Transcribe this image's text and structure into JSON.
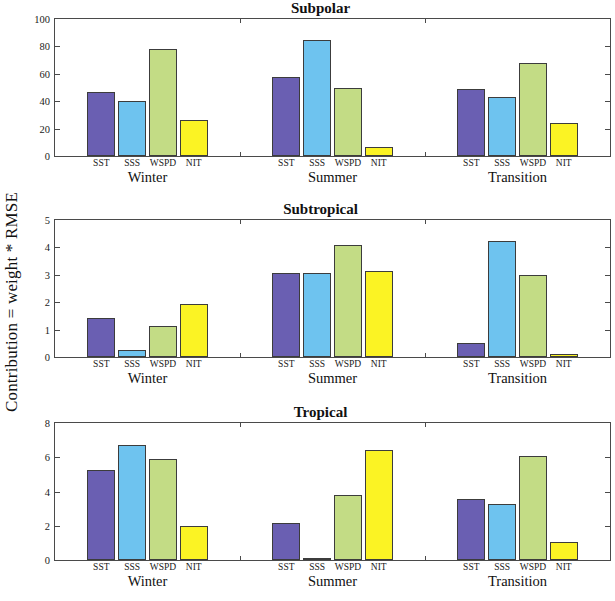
{
  "figure": {
    "ylabel": "Contribution = weight * RMSE",
    "group_labels": [
      "Winter",
      "Summer",
      "Transition"
    ],
    "variable_labels": [
      "SST",
      "SSS",
      "WSPD",
      "NIT"
    ],
    "colors": {
      "SST": "#6a5fb2",
      "SSS": "#6ec3ef",
      "WSPD": "#c3dc85",
      "NIT": "#fbf324",
      "axis": "#4a4a4a",
      "background": "#ffffff"
    }
  },
  "chart_data": [
    {
      "type": "bar",
      "title": "Subpolar",
      "xlabel": "",
      "ylabel": "Contribution = weight * RMSE",
      "categories": [
        "Winter",
        "Summer",
        "Transition"
      ],
      "series": [
        {
          "name": "SST",
          "values": [
            47,
            58,
            49
          ]
        },
        {
          "name": "SSS",
          "values": [
            40,
            85,
            43
          ]
        },
        {
          "name": "WSPD",
          "values": [
            78,
            50,
            68
          ]
        },
        {
          "name": "NIT",
          "values": [
            26,
            6.5,
            24
          ]
        }
      ],
      "ylim": [
        0,
        100
      ],
      "yticks": [
        0,
        20,
        40,
        60,
        80,
        100
      ],
      "grid": false,
      "legend": "none"
    },
    {
      "type": "bar",
      "title": "Subtropical",
      "xlabel": "",
      "ylabel": "Contribution = weight * RMSE",
      "categories": [
        "Winter",
        "Summer",
        "Transition"
      ],
      "series": [
        {
          "name": "SST",
          "values": [
            1.42,
            3.05,
            0.5
          ]
        },
        {
          "name": "SSS",
          "values": [
            0.25,
            3.05,
            4.25
          ]
        },
        {
          "name": "WSPD",
          "values": [
            1.15,
            4.1,
            3.0
          ]
        },
        {
          "name": "NIT",
          "values": [
            1.95,
            3.15,
            0.12
          ]
        }
      ],
      "ylim": [
        0,
        5
      ],
      "yticks": [
        0,
        1,
        2,
        3,
        4,
        5
      ],
      "grid": false,
      "legend": "none"
    },
    {
      "type": "bar",
      "title": "Tropical",
      "xlabel": "",
      "ylabel": "Contribution = weight * RMSE",
      "categories": [
        "Winter",
        "Summer",
        "Transition"
      ],
      "series": [
        {
          "name": "SST",
          "values": [
            5.25,
            2.15,
            3.55
          ]
        },
        {
          "name": "SSS",
          "values": [
            6.7,
            0.12,
            3.3
          ]
        },
        {
          "name": "WSPD",
          "values": [
            5.9,
            3.8,
            6.05
          ]
        },
        {
          "name": "NIT",
          "values": [
            2.0,
            6.4,
            1.05
          ]
        }
      ],
      "ylim": [
        0,
        8
      ],
      "yticks": [
        0,
        2,
        4,
        6,
        8
      ],
      "grid": false,
      "legend": "none"
    }
  ]
}
